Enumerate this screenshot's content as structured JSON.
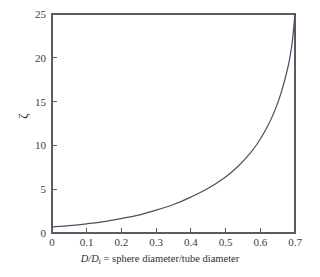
{
  "chart_data": {
    "type": "line",
    "title": "",
    "subtitle": "",
    "xlabel_parts": {
      "numerator": "D",
      "slash": "/",
      "denominator": "D",
      "denominator_sub": "t",
      "rest": " = sphere diameter/tube diameter"
    },
    "xlabel": "D/Dt = sphere diameter/tube diameter",
    "ylabel": "ζ",
    "xlim": [
      0,
      0.7
    ],
    "ylim": [
      0,
      25
    ],
    "xticks": [
      0,
      0.1,
      0.2,
      0.3,
      0.4,
      0.5,
      0.6,
      0.7
    ],
    "xticklabels": [
      "0",
      "0.1",
      "0.2",
      "0.3",
      "0.4",
      "0.5",
      "0.6",
      "0.7"
    ],
    "yticks": [
      0,
      5,
      10,
      15,
      20,
      25
    ],
    "yticklabels": [
      "0",
      "5",
      "10",
      "15",
      "20",
      "25"
    ],
    "grid": false,
    "legend": null,
    "series": [
      {
        "name": "zeta",
        "color": "#4b4f63",
        "x": [
          0.0,
          0.05,
          0.1,
          0.15,
          0.2,
          0.25,
          0.3,
          0.35,
          0.4,
          0.45,
          0.5,
          0.53,
          0.56,
          0.59,
          0.62,
          0.64,
          0.66,
          0.68,
          0.69,
          0.695,
          0.7
        ],
        "values": [
          0.7,
          0.85,
          1.05,
          1.3,
          1.65,
          2.05,
          2.6,
          3.25,
          4.1,
          5.1,
          6.4,
          7.4,
          8.6,
          10.1,
          12.1,
          13.8,
          16.0,
          19.0,
          21.2,
          22.9,
          25.0
        ]
      }
    ],
    "annotations": []
  },
  "figure": {
    "axes_color": "#5a5a66",
    "background": "#ffffff",
    "curve_color": "#4b4f63",
    "text_color": "#2f2f2f"
  }
}
